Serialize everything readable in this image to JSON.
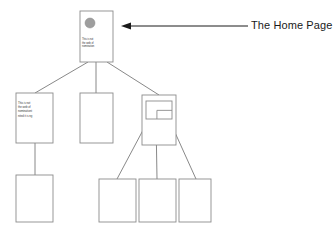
{
  "diagram": {
    "type": "site-map-tree",
    "title": "The Home Page",
    "colors": {
      "box_stroke": "#8c8c8c",
      "connector_stroke": "#7a7a7a",
      "arrow_stroke": "#1a1a1a",
      "label_text": "#1a1a1a",
      "node_text": "#3a3a3a",
      "circle_fill": "#9e9e9e",
      "background": "#ffffff"
    },
    "annotation": {
      "label": "The Home Page",
      "arrow_name": "leftward-arrow",
      "arrow_from_x": 248,
      "arrow_to_x": 121,
      "arrow_y": 26
    },
    "nodes": [
      {
        "id": "root",
        "name": "home-page-node",
        "level": 0,
        "x": 80,
        "y": 11,
        "w": 33,
        "h": 51,
        "text": "This is not\nthe web of\nnomination",
        "has_circle": true,
        "circle": {
          "cx": 90,
          "cy": 23,
          "r": 5
        }
      },
      {
        "id": "branch-left",
        "name": "sub-page-node-left",
        "level": 1,
        "x": 16,
        "y": 93,
        "w": 37,
        "h": 50,
        "text": "This is not\nthe web of\nnominationt\nnited it is  ng",
        "has_circle": false
      },
      {
        "id": "branch-center",
        "name": "sub-page-node-center",
        "level": 1,
        "x": 80,
        "y": 93,
        "w": 33,
        "h": 50,
        "text": "",
        "has_circle": false
      },
      {
        "id": "branch-right",
        "name": "sub-page-node-right",
        "level": 1,
        "x": 142,
        "y": 95,
        "w": 34,
        "h": 50,
        "text": "",
        "has_circle": false,
        "inner_rect": {
          "x": 146,
          "y": 101,
          "w": 26,
          "h": 18
        }
      },
      {
        "id": "leaf-left",
        "name": "leaf-page-node-left",
        "level": 2,
        "x": 16,
        "y": 175,
        "w": 37,
        "h": 47,
        "text": "",
        "has_circle": false
      },
      {
        "id": "leaf-1",
        "name": "leaf-page-node-1",
        "level": 2,
        "x": 99,
        "y": 179,
        "w": 37,
        "h": 43,
        "text": "",
        "has_circle": false
      },
      {
        "id": "leaf-2",
        "name": "leaf-page-node-2",
        "level": 2,
        "x": 139,
        "y": 179,
        "w": 37,
        "h": 43,
        "text": "",
        "has_circle": false
      },
      {
        "id": "leaf-3",
        "name": "leaf-page-node-3",
        "level": 2,
        "x": 179,
        "y": 179,
        "w": 32,
        "h": 43,
        "text": "",
        "has_circle": false
      }
    ],
    "connectors": [
      {
        "name": "connector-root-to-left",
        "x1": 88,
        "y1": 62,
        "x2": 35,
        "y2": 93
      },
      {
        "name": "connector-root-to-center",
        "x1": 96,
        "y1": 62,
        "x2": 96,
        "y2": 93
      },
      {
        "name": "connector-root-to-right",
        "x1": 107,
        "y1": 62,
        "x2": 159,
        "y2": 95
      },
      {
        "name": "connector-left-to-leaf",
        "x1": 35,
        "y1": 143,
        "x2": 35,
        "y2": 175
      },
      {
        "name": "connector-right-to-leaf1",
        "x1": 150,
        "y1": 117,
        "x2": 117,
        "y2": 179
      },
      {
        "name": "connector-right-to-leaf2",
        "x1": 156,
        "y1": 119,
        "x2": 157,
        "y2": 179
      },
      {
        "name": "connector-right-to-leaf3",
        "x1": 168,
        "y1": 117,
        "x2": 196,
        "y2": 179
      }
    ]
  }
}
